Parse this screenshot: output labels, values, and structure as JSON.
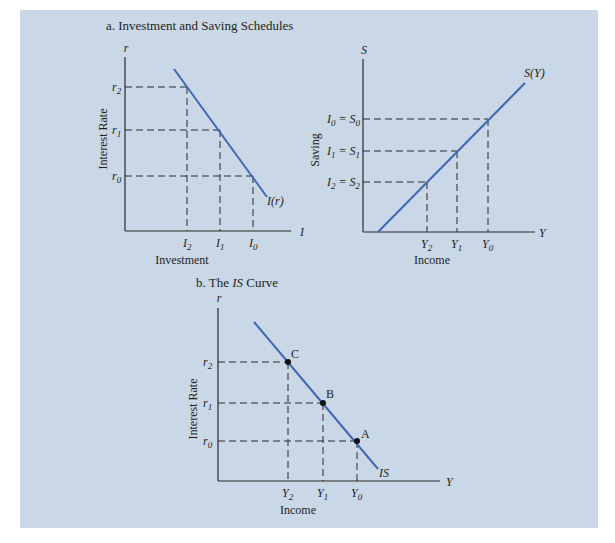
{
  "panel_background": "#c9d7e6",
  "curve_color": "#3f68b5",
  "axis_color": "#2a2a2a",
  "panel_a": {
    "title": "a. Investment and Saving Schedules",
    "investment_chart": {
      "y_axis_symbol": "r",
      "x_axis_symbol": "I",
      "y_axis_label": "Interest Rate",
      "x_axis_label": "Investment",
      "curve_label": "I(r)",
      "y_ticks": [
        {
          "label": "r",
          "sub": "2"
        },
        {
          "label": "r",
          "sub": "1"
        },
        {
          "label": "r",
          "sub": "0"
        }
      ],
      "x_ticks": [
        {
          "label": "I",
          "sub": "2"
        },
        {
          "label": "I",
          "sub": "1"
        },
        {
          "label": "I",
          "sub": "0"
        }
      ]
    },
    "saving_chart": {
      "y_axis_symbol": "S",
      "x_axis_symbol": "Y",
      "y_axis_label": "Saving",
      "x_axis_label": "Income",
      "curve_label": "S(Y)",
      "y_ticks": [
        {
          "label": "I",
          "sub": "0",
          "eq": " = S",
          "eqsub": "0"
        },
        {
          "label": "I",
          "sub": "1",
          "eq": " = S",
          "eqsub": "1"
        },
        {
          "label": "I",
          "sub": "2",
          "eq": " = S",
          "eqsub": "2"
        }
      ],
      "x_ticks": [
        {
          "label": "Y",
          "sub": "2"
        },
        {
          "label": "Y",
          "sub": "1"
        },
        {
          "label": "Y",
          "sub": "0"
        }
      ]
    }
  },
  "panel_b": {
    "title_prefix": "b. The ",
    "title_italic": "IS",
    "title_suffix": " Curve",
    "y_axis_symbol": "r",
    "x_axis_symbol": "Y",
    "y_axis_label": "Interest Rate",
    "x_axis_label": "Income",
    "curve_label": "IS",
    "points": [
      "C",
      "B",
      "A"
    ],
    "y_ticks": [
      {
        "label": "r",
        "sub": "2"
      },
      {
        "label": "r",
        "sub": "1"
      },
      {
        "label": "r",
        "sub": "0"
      }
    ],
    "x_ticks": [
      {
        "label": "Y",
        "sub": "2"
      },
      {
        "label": "Y",
        "sub": "1"
      },
      {
        "label": "Y",
        "sub": "0"
      }
    ]
  }
}
